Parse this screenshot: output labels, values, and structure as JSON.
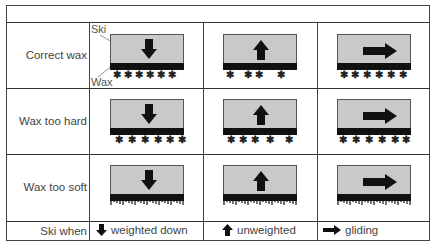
{
  "table": {
    "row_labels": [
      "Correct wax",
      "Wax too hard",
      "Wax too soft"
    ],
    "footer_label": "Ski when",
    "columns": [
      {
        "icon": "arrow-down-icon",
        "label": "weighted down"
      },
      {
        "icon": "arrow-up-icon",
        "label": "unweighted"
      },
      {
        "icon": "arrow-right-icon",
        "label": "gliding"
      }
    ],
    "callouts": {
      "ski": "Ski",
      "wax": "Wax"
    }
  },
  "colors": {
    "ski_body": "#c9c9c9",
    "wax": "#111111",
    "grid": "#444444"
  },
  "cells": [
    [
      {
        "grip_points": [
          3,
          14,
          25,
          36,
          47,
          58
        ],
        "mode": "stars"
      },
      {
        "grip_points": [
          3,
          21,
          32,
          54
        ],
        "mode": "stars"
      },
      {
        "grip_points": [
          3,
          14,
          26,
          38,
          50,
          62
        ],
        "mode": "stars"
      }
    ],
    [
      {
        "grip_points": [
          5,
          18,
          31,
          44,
          56,
          68
        ],
        "mode": "stars"
      },
      {
        "grip_points": [
          4,
          16,
          28,
          43,
          62
        ],
        "mode": "stars"
      },
      {
        "grip_points": [
          2,
          15,
          28,
          41,
          54,
          65
        ],
        "mode": "stars"
      }
    ],
    [
      {
        "mode": "soft"
      },
      {
        "mode": "soft"
      },
      {
        "mode": "soft"
      }
    ]
  ]
}
